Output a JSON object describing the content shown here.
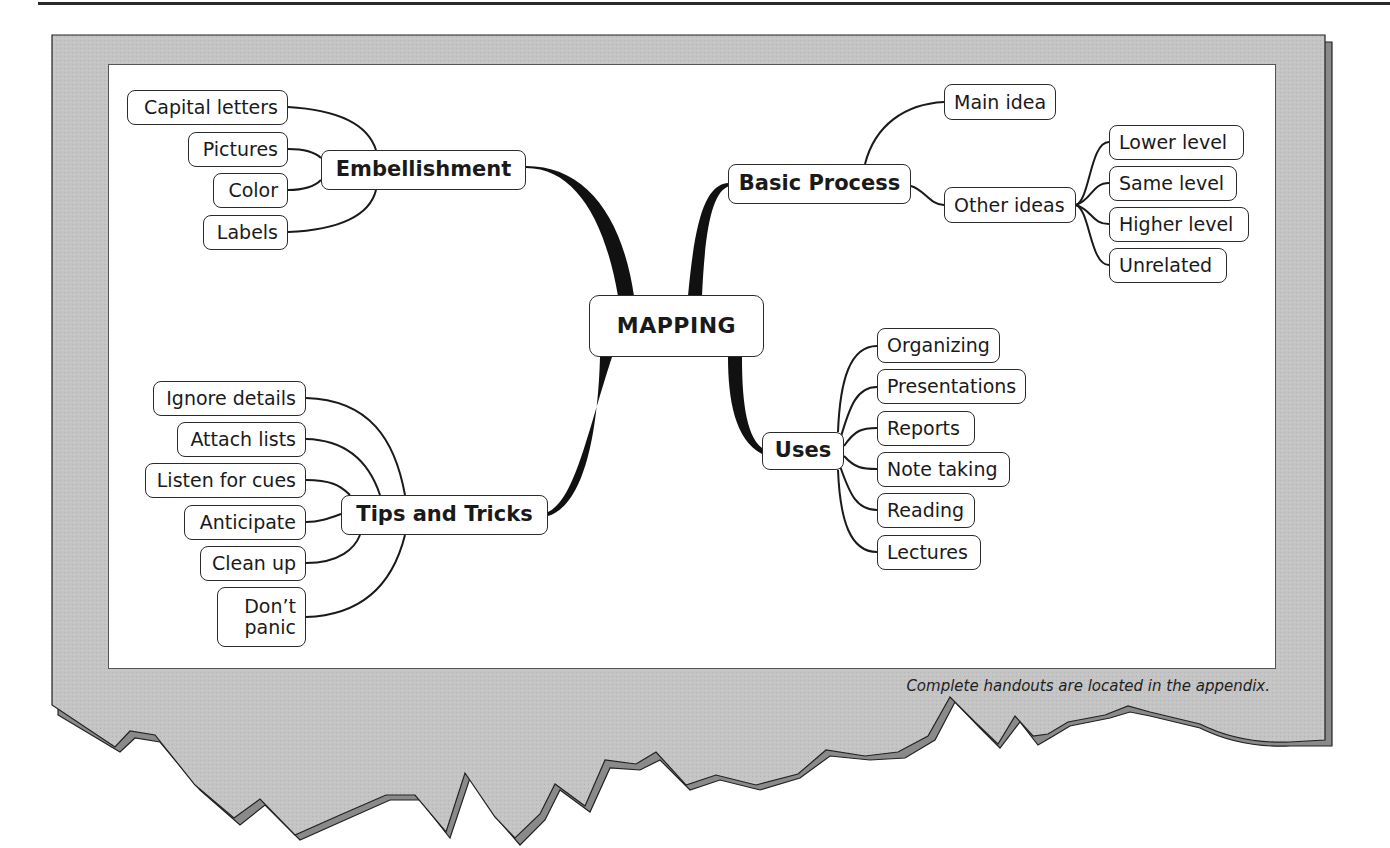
{
  "colors": {
    "paper": "#c4c4c4",
    "paper_shadow": "#8a8a8a",
    "outline": "#2b2b2b",
    "node_fill": "#ffffff",
    "text": "#1a1a1a"
  },
  "map": {
    "center": "MAPPING",
    "branches": {
      "embellishment": {
        "label": "Embellishment",
        "children": [
          "Capital letters",
          "Pictures",
          "Color",
          "Labels"
        ]
      },
      "basic_process": {
        "label": "Basic Process",
        "children": [
          "Main idea",
          "Other ideas"
        ],
        "other_ideas_children": [
          "Lower level",
          "Same level",
          "Higher level",
          "Unrelated"
        ]
      },
      "uses": {
        "label": "Uses",
        "children": [
          "Organizing",
          "Presentations",
          "Reports",
          "Note taking",
          "Reading",
          "Lectures"
        ]
      },
      "tips": {
        "label": "Tips and Tricks",
        "children": [
          "Ignore details",
          "Attach lists",
          "Listen for cues",
          "Anticipate",
          "Clean up"
        ],
        "last_child_lines": [
          "Don’t",
          "panic"
        ]
      }
    }
  },
  "caption": "Complete handouts are located in the appendix."
}
